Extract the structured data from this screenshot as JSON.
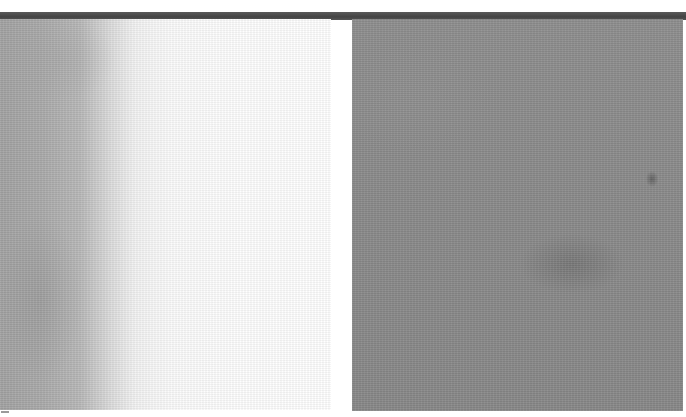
{
  "image": {
    "description": "Two grayscale texture photographs side by side beneath a dark horizontal bar",
    "top_bar": {
      "color": "#4a4a4a"
    },
    "panels": [
      {
        "id": "left",
        "tone": "gray-to-white gradient texture",
        "colors": [
          "#a3a3a3",
          "#ffffff"
        ]
      },
      {
        "id": "right",
        "tone": "mid-gray noisy texture",
        "colors": [
          "#8c8c8c",
          "#7a7a7a"
        ]
      }
    ]
  }
}
